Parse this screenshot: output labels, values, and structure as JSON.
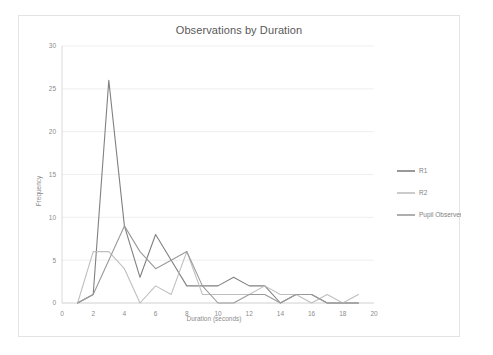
{
  "chart_data": {
    "type": "line",
    "title": "Observations by Duration",
    "xlabel": "Duration (seconds)",
    "ylabel": "Frequency",
    "xlim": [
      0,
      20
    ],
    "ylim": [
      0,
      30
    ],
    "xticks": [
      "0",
      "2",
      "4",
      "6",
      "8",
      "10",
      "12",
      "14",
      "16",
      "18",
      "20"
    ],
    "yticks": [
      "0",
      "5",
      "10",
      "15",
      "20",
      "25",
      "30"
    ],
    "grid": "horizontal",
    "legend_position": "right",
    "x": [
      1,
      2,
      3,
      4,
      5,
      6,
      7,
      8,
      9,
      10,
      11,
      12,
      13,
      14,
      15,
      16,
      17,
      18,
      19
    ],
    "series": [
      {
        "name": "R1",
        "color": "#808080",
        "values": [
          0,
          1,
          26,
          9,
          3,
          8,
          5,
          2,
          2,
          2,
          3,
          2,
          2,
          0,
          1,
          1,
          0,
          0,
          0
        ]
      },
      {
        "name": "R2",
        "color": "#bfbfbf",
        "values": [
          0,
          6,
          6,
          4,
          0,
          2,
          1,
          6,
          1,
          1,
          1,
          1,
          2,
          1,
          1,
          0,
          1,
          0,
          1
        ]
      },
      {
        "name": "Pupil Observer",
        "color": "#9a9a9a",
        "values": [
          0,
          1,
          5,
          9,
          6,
          4,
          5,
          6,
          2,
          0,
          0,
          1,
          1,
          0,
          1,
          1,
          0,
          0,
          0
        ]
      }
    ]
  },
  "legend": {
    "entries": [
      "R1",
      "R2",
      "Pupil Observer"
    ]
  }
}
